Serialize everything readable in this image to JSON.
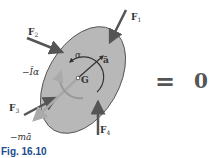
{
  "figure": {
    "caption": "Fig. 16.10",
    "equals_sign": "=",
    "rhs": "0",
    "body_center_label": "G",
    "angular_accel_label": "α",
    "accel_label": "ā",
    "inertia_couple_label": "−Īα",
    "inertia_force_label": "−mā",
    "forces": [
      {
        "name": "F",
        "sub": "1"
      },
      {
        "name": "F",
        "sub": "2"
      },
      {
        "name": "F",
        "sub": "3"
      },
      {
        "name": "F",
        "sub": "4"
      }
    ]
  },
  "colors": {
    "body_fill": "#b8b8b8",
    "arrow_dark": "#555555",
    "arrow_light": "#a8a8a8",
    "caption": "#1a4b8c"
  }
}
